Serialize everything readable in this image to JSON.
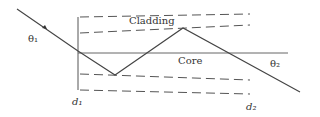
{
  "diagram": {
    "labels": {
      "cladding": "Cladding",
      "core": "Core",
      "theta1": "θ₁",
      "theta2": "θ₂",
      "d1": "d₁",
      "d2": "d₂"
    },
    "colors": {
      "line": "#444444",
      "text": "#333333"
    }
  }
}
